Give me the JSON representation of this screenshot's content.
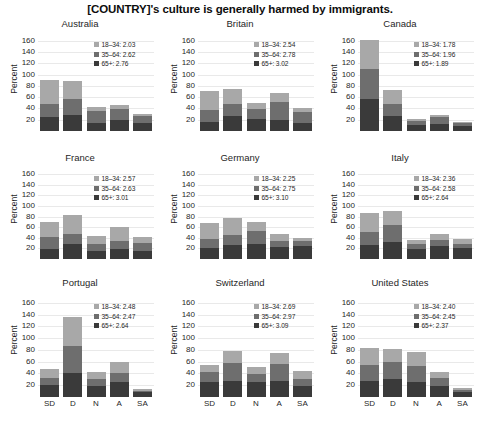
{
  "figure": {
    "title": "[COUNTRY]'s culture is generally harmed by immigrants.",
    "ylabel": "Percent",
    "xlabel": ""
  },
  "axes": {
    "yticks": [
      "160",
      "140",
      "120",
      "100",
      "80",
      "60",
      "40",
      "20"
    ],
    "ymin": 0,
    "ymax": 170,
    "xticks": [
      "SD",
      "D",
      "N",
      "A",
      "SA"
    ]
  },
  "legend_keys": [
    {
      "key": "18-34",
      "label": "18–34:",
      "color": "#a8a8a8"
    },
    {
      "key": "35-64",
      "label": "35–64:",
      "color": "#6e6e6e"
    },
    {
      "key": "65+",
      "label": "65+:",
      "color": "#3a3a3a"
    }
  ],
  "chart_data": {
    "type": "bar",
    "title": "[COUNTRY]'s culture is generally harmed by immigrants.",
    "xlabel": "",
    "ylabel": "Percent",
    "ylim": [
      0,
      170
    ],
    "grid": true,
    "legend_position": "upper right",
    "stacked": true,
    "categories": [
      "SD",
      "D",
      "N",
      "A",
      "SA"
    ],
    "series_names": [
      "18-34",
      "35-64",
      "65+"
    ],
    "panels": [
      {
        "name": "Australia",
        "legend": {
          "18-34": "2.03",
          "35-64": "2.62",
          "65+": "2.76"
        },
        "series": [
          {
            "name": "65+",
            "values": [
              24,
              29,
              15,
              20,
              15
            ]
          },
          {
            "name": "35-64",
            "values": [
              23,
              28,
              21,
              19,
              12
            ]
          },
          {
            "name": "18-34",
            "values": [
              44,
              31,
              7,
              7,
              4
            ]
          }
        ],
        "totals": [
          91,
          88,
          43,
          46,
          31
        ]
      },
      {
        "name": "Britain",
        "legend": {
          "18-34": "2.54",
          "35-64": "2.78",
          "65+": "3.02"
        },
        "series": [
          {
            "name": "65+",
            "values": [
              16,
              26,
              21,
              20,
              14
            ]
          },
          {
            "name": "35-64",
            "values": [
              22,
              22,
              18,
              32,
              20
            ]
          },
          {
            "name": "18-34",
            "values": [
              32,
              27,
              11,
              16,
              6
            ]
          }
        ],
        "totals": [
          70,
          75,
          50,
          68,
          40
        ]
      },
      {
        "name": "Canada",
        "legend": {
          "18-34": "1.78",
          "35-64": "1.96",
          "65+": "1.89"
        },
        "series": [
          {
            "name": "65+",
            "values": [
              57,
              26,
              11,
              13,
              9
            ]
          },
          {
            "name": "35-64",
            "values": [
              52,
              22,
              7,
              11,
              5
            ]
          },
          {
            "name": "18-34",
            "values": [
              53,
              25,
              4,
              4,
              2
            ]
          }
        ],
        "totals": [
          162,
          73,
          22,
          28,
          16
        ]
      },
      {
        "name": "France",
        "legend": {
          "18-34": "2.57",
          "35-64": "2.63",
          "65+": "3.01"
        },
        "series": [
          {
            "name": "65+",
            "values": [
              19,
              28,
              16,
              18,
              16
            ]
          },
          {
            "name": "35-64",
            "values": [
              23,
              19,
              13,
              16,
              15
            ]
          },
          {
            "name": "18-34",
            "values": [
              28,
              36,
              14,
              26,
              10
            ]
          }
        ],
        "totals": [
          70,
          83,
          43,
          60,
          41
        ]
      },
      {
        "name": "Germany",
        "legend": {
          "18-34": "2.25",
          "35-64": "2.75",
          "65+": "3.10"
        },
        "series": [
          {
            "name": "65+",
            "values": [
              20,
              27,
              29,
              22,
              24
            ]
          },
          {
            "name": "35-64",
            "values": [
              17,
              19,
              23,
              12,
              10
            ]
          },
          {
            "name": "18-34",
            "values": [
              31,
              32,
              17,
              14,
              5
            ]
          }
        ],
        "totals": [
          68,
          78,
          69,
          48,
          39
        ]
      },
      {
        "name": "Italy",
        "legend": {
          "18-34": "2.36",
          "35-64": "2.58",
          "65+": "2.64"
        },
        "series": [
          {
            "name": "65+",
            "values": [
              27,
              32,
              18,
              25,
              20
            ]
          },
          {
            "name": "35-64",
            "values": [
              24,
              33,
              10,
              10,
              9
            ]
          },
          {
            "name": "18-34",
            "values": [
              36,
              26,
              8,
              13,
              8
            ]
          }
        ],
        "totals": [
          87,
          91,
          36,
          48,
          37
        ]
      },
      {
        "name": "Portugal",
        "legend": {
          "18-34": "2.48",
          "35-64": "2.47",
          "65+": "2.64"
        },
        "series": [
          {
            "name": "65+",
            "values": [
              21,
              40,
              19,
              26,
              8
            ]
          },
          {
            "name": "35-64",
            "values": [
              11,
              46,
              12,
              15,
              3
            ]
          },
          {
            "name": "18-34",
            "values": [
              15,
              50,
              12,
              19,
              2
            ]
          }
        ],
        "totals": [
          47,
          136,
          43,
          60,
          13
        ]
      },
      {
        "name": "Switzerland",
        "legend": {
          "18-34": "2.69",
          "35-64": "2.97",
          "65+": "3.09"
        },
        "series": [
          {
            "name": "65+",
            "values": [
              26,
              28,
              25,
              27,
              19
            ]
          },
          {
            "name": "35-64",
            "values": [
              16,
              29,
              14,
              29,
              12
            ]
          },
          {
            "name": "18-34",
            "values": [
              12,
              21,
              12,
              18,
              13
            ]
          }
        ],
        "totals": [
          54,
          78,
          51,
          74,
          44
        ]
      },
      {
        "name": "United States",
        "legend": {
          "18-34": "2.40",
          "35-64": "2.45",
          "65+": "2.37"
        },
        "series": [
          {
            "name": "65+",
            "values": [
              28,
              30,
              26,
              19,
              8
            ]
          },
          {
            "name": "35-64",
            "values": [
              26,
              29,
              27,
              14,
              4
            ]
          },
          {
            "name": "18-34",
            "values": [
              29,
              23,
              24,
              10,
              3
            ]
          }
        ],
        "totals": [
          83,
          82,
          77,
          43,
          15
        ]
      }
    ]
  }
}
